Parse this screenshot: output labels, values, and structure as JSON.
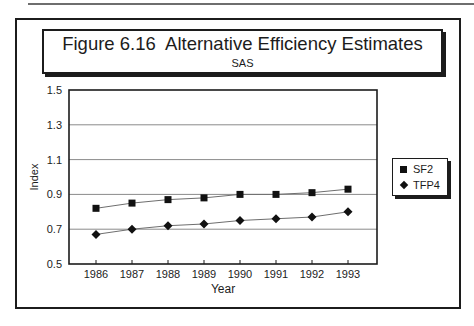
{
  "figure": {
    "title": "Figure 6.16  Alternative Efficiency Estimates",
    "subtitle": "SAS"
  },
  "chart_data": {
    "type": "line",
    "title": "Figure 6.16  Alternative Efficiency Estimates",
    "subtitle": "SAS",
    "categories": [
      "1986",
      "1987",
      "1988",
      "1989",
      "1990",
      "1991",
      "1992",
      "1993"
    ],
    "series": [
      {
        "name": "SF2",
        "marker": "square",
        "values": [
          0.82,
          0.85,
          0.87,
          0.88,
          0.9,
          0.9,
          0.91,
          0.93
        ]
      },
      {
        "name": "TFP4",
        "marker": "diamond",
        "values": [
          0.67,
          0.7,
          0.72,
          0.73,
          0.75,
          0.76,
          0.77,
          0.8
        ]
      }
    ],
    "xlabel": "Year",
    "ylabel": "Index",
    "ylim": [
      0.5,
      1.5
    ],
    "yticks": [
      0.5,
      0.7,
      0.9,
      1.1,
      1.3,
      1.5
    ],
    "grid": true,
    "legend_position": "right"
  },
  "colors": {
    "ink": "#1c1c1c",
    "gridline": "#8a8a8a",
    "series_line": "#6e6e6e",
    "marker": "#111111",
    "background": "#ffffff"
  }
}
